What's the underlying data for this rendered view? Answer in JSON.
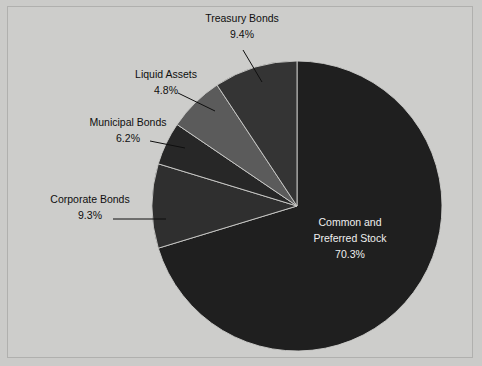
{
  "chart_data": {
    "type": "pie",
    "title": "",
    "subtitle": "",
    "xlabel": "",
    "ylabel": "",
    "legend_position": "none",
    "grid": false,
    "units": "percent",
    "start_angle_deg": 0,
    "direction": "clockwise",
    "categories": [
      "Common and Preferred Stock",
      "Treasury Bonds",
      "Liquid Assets",
      "Municipal Bonds",
      "Corporate Bonds"
    ],
    "values": [
      70.3,
      9.4,
      4.8,
      6.2,
      9.3
    ],
    "slices": [
      {
        "label": "Common and Preferred Stock",
        "label_line1": "Common and",
        "label_line2": "Preferred Stock",
        "value": 70.3,
        "value_text": "70.3%",
        "color": "#1f1f1f",
        "label_placement": "inside",
        "text_color": "#efefef"
      },
      {
        "label": "Treasury Bonds",
        "label_line1": "Treasury Bonds",
        "label_line2": "",
        "value": 9.4,
        "value_text": "9.4%",
        "color": "#2f2f2f",
        "label_placement": "outside",
        "text_color": "#0f0f0f"
      },
      {
        "label": "Liquid Assets",
        "label_line1": "Liquid Assets",
        "label_line2": "",
        "value": 4.8,
        "value_text": "4.8%",
        "color": "#272727",
        "label_placement": "outside",
        "text_color": "#0f0f0f"
      },
      {
        "label": "Municipal Bonds",
        "label_line1": "Municipal Bonds",
        "label_line2": "",
        "value": 6.2,
        "value_text": "6.2%",
        "color": "#5b5b5b",
        "label_placement": "outside",
        "text_color": "#0f0f0f"
      },
      {
        "label": "Corporate Bonds",
        "label_line1": "Corporate Bonds",
        "label_line2": "",
        "value": 9.3,
        "value_text": "9.3%",
        "color": "#343434",
        "label_placement": "outside",
        "text_color": "#0f0f0f"
      }
    ]
  },
  "figure": {
    "background_color": "#cdcdcb",
    "border_color": "#b0b0ae",
    "center_x": 297,
    "center_y": 206,
    "radius": 145
  },
  "labels": {
    "treasury_name": "Treasury Bonds",
    "treasury_value": "9.4%",
    "liquid_name": "Liquid Assets",
    "liquid_value": "4.8%",
    "municipal_name": "Municipal Bonds",
    "municipal_value": "6.2%",
    "corporate_name": "Corporate Bonds",
    "corporate_value": "9.3%",
    "stock_name_line1": "Common and",
    "stock_name_line2": "Preferred Stock",
    "stock_value": "70.3%"
  }
}
